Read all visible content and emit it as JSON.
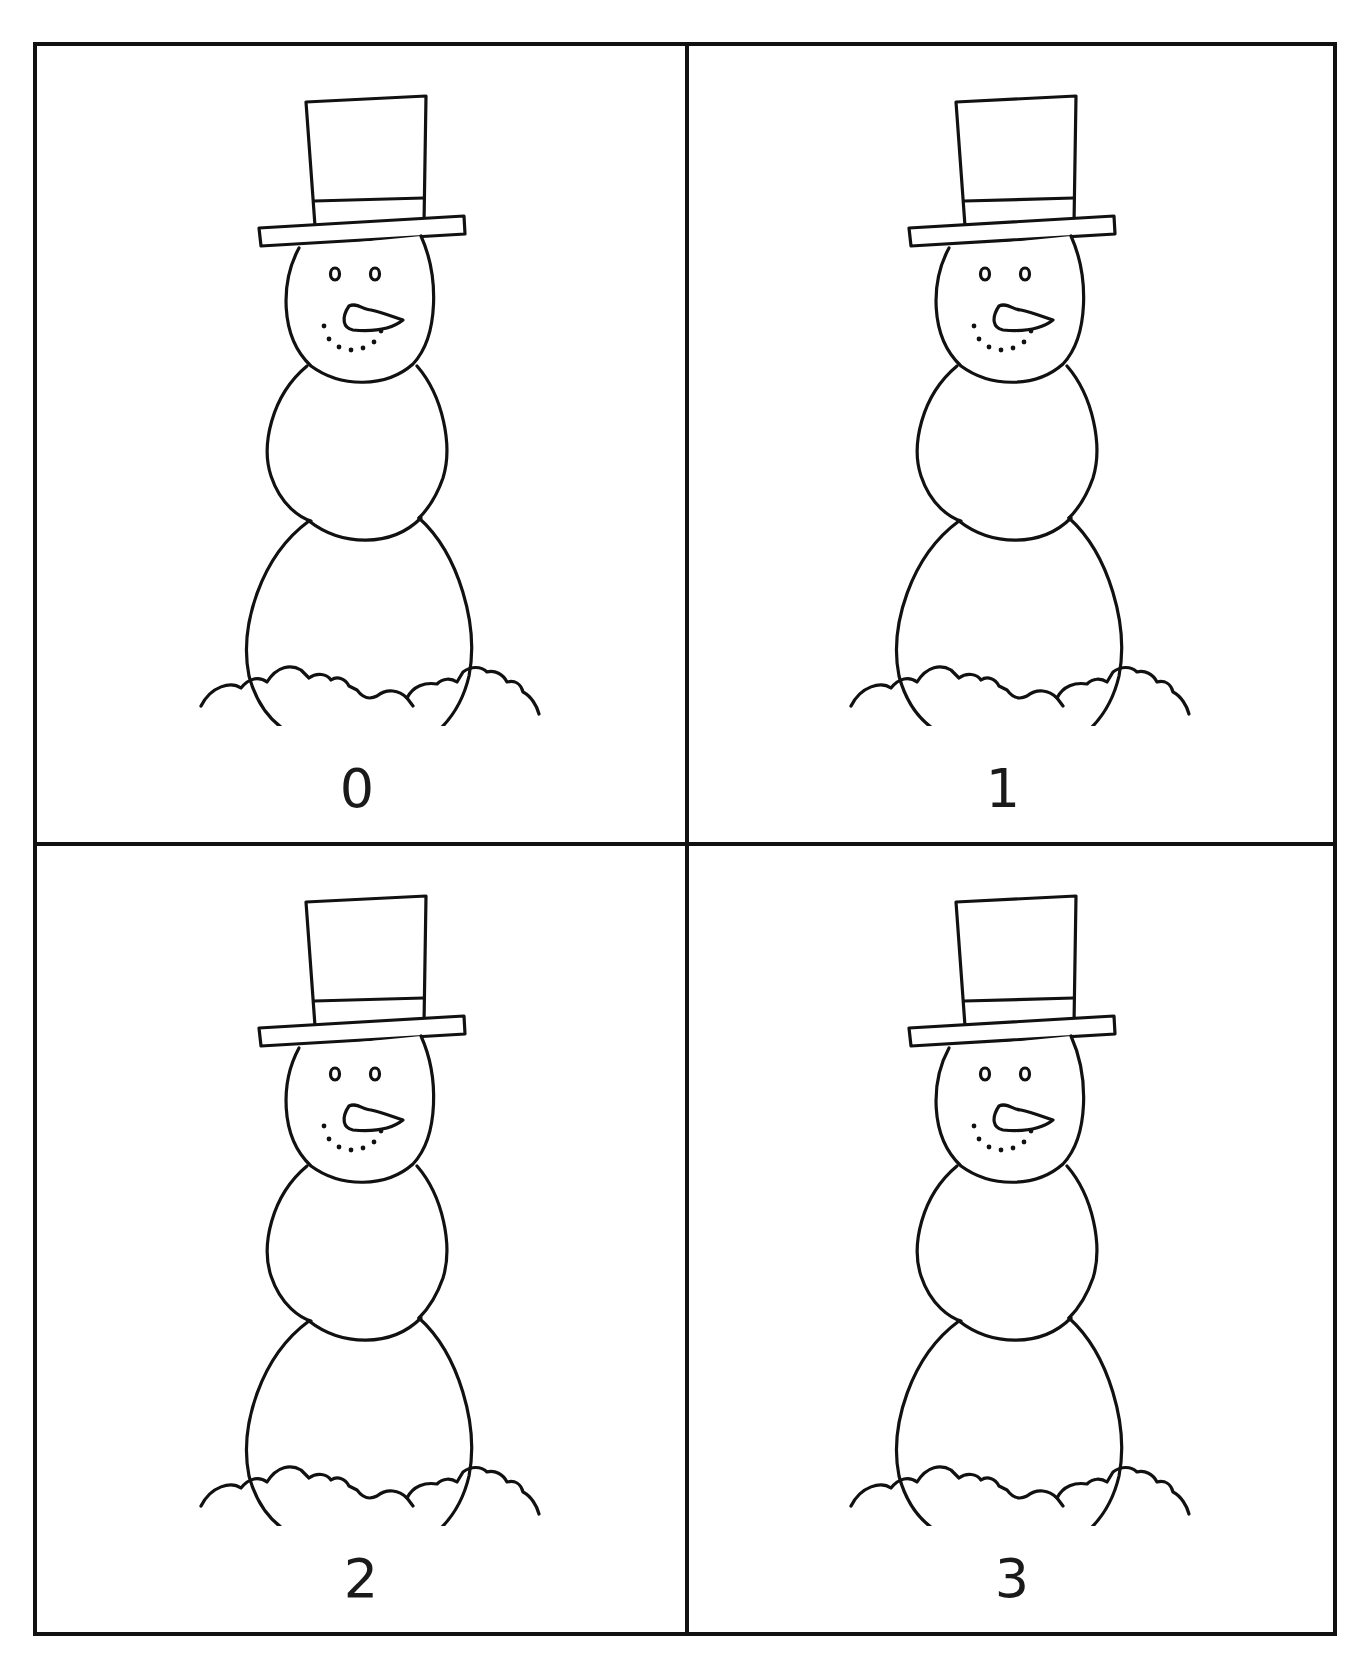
{
  "worksheet": {
    "cards": [
      {
        "number": "0",
        "image": "snowman-with-top-hat"
      },
      {
        "number": "1",
        "image": "snowman-with-top-hat"
      },
      {
        "number": "2",
        "image": "snowman-with-top-hat"
      },
      {
        "number": "3",
        "image": "snowman-with-top-hat"
      }
    ],
    "colors": {
      "line": "#111111",
      "background": "#ffffff"
    }
  }
}
